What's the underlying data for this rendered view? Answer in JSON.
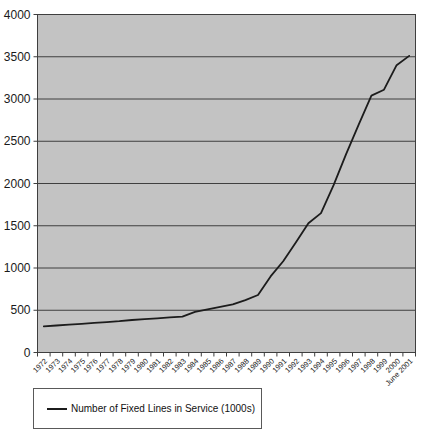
{
  "chart_data": {
    "type": "line",
    "title": "",
    "xlabel": "",
    "ylabel": "",
    "categories": [
      "1972",
      "1973",
      "1974",
      "1975",
      "1976",
      "1977",
      "1978",
      "1979",
      "1980",
      "1981",
      "1982",
      "1983",
      "1984",
      "1985",
      "1986",
      "1987",
      "1988",
      "1989",
      "1990",
      "1991",
      "1992",
      "1993",
      "1994",
      "1995",
      "1996",
      "1997",
      "1998",
      "1999",
      "2000",
      "June 2001"
    ],
    "series": [
      {
        "name": "Number of Fixed Lines in Service (1000s)",
        "values": [
          310,
          320,
          330,
          340,
          350,
          360,
          370,
          385,
          395,
          405,
          415,
          425,
          480,
          510,
          540,
          570,
          620,
          680,
          900,
          1080,
          1300,
          1530,
          1650,
          1980,
          2350,
          2700,
          3040,
          3110,
          3400,
          3510
        ]
      }
    ],
    "ylim": [
      0,
      4000
    ],
    "ytick_step": 500,
    "ytick_labels": [
      "0",
      "500",
      "1000",
      "1500",
      "2000",
      "2500",
      "3000",
      "3500",
      "4000"
    ],
    "grid": "horizontal",
    "legend_position": "bottom-left",
    "colors": {
      "plot_background": "#c3c3c3",
      "grid_line": "#3f3f3f",
      "series_line": "#1c1c1c",
      "axis_text": "#1a1a1a",
      "page_background": "#ffffff"
    }
  }
}
